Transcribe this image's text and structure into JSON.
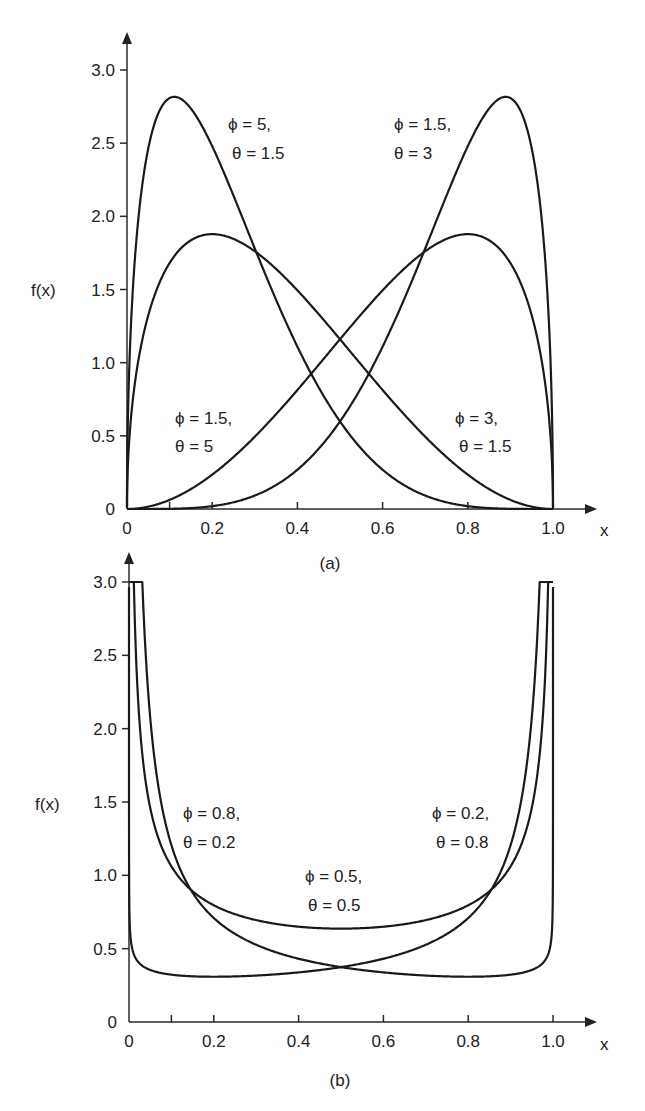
{
  "chart_data": [
    {
      "type": "line",
      "panel_label": "(a)",
      "title": "",
      "xlabel": "x",
      "ylabel": "f(x)",
      "xlim": [
        0,
        1.0
      ],
      "ylim": [
        0,
        3.0
      ],
      "x_ticks": [
        "0",
        "0.2",
        "0.4",
        "0.6",
        "0.8",
        "1.0"
      ],
      "x_minor_ticks": [
        0.1
      ],
      "y_ticks": [
        "0",
        "0.5",
        "1.0",
        "1.5",
        "2.0",
        "2.5",
        "3.0"
      ],
      "grid": false,
      "legend": "inline annotations",
      "series": [
        {
          "name": "φ = 5, θ = 1.5",
          "phi": 5,
          "theta": 1.5,
          "peak_x": 0.11,
          "peak_y": 2.82
        },
        {
          "name": "φ = 1.5, θ = 5",
          "phi": 1.5,
          "theta": 5,
          "peak_x": 0.2,
          "peak_y": 1.88
        },
        {
          "name": "φ = 1.5, θ = 3",
          "phi": 1.5,
          "theta": 3,
          "peak_x": 0.89,
          "peak_y": 2.82
        },
        {
          "name": "φ = 3, θ = 1.5",
          "phi": 3,
          "theta": 1.5,
          "peak_x": 0.8,
          "peak_y": 1.88
        }
      ],
      "annotations": [
        {
          "phi_label": "ϕ = 5,",
          "theta_label": "θ = 1.5"
        },
        {
          "phi_label": "ϕ = 1.5,",
          "theta_label": "θ = 3"
        },
        {
          "phi_label": "ϕ = 1.5,",
          "theta_label": "θ = 5"
        },
        {
          "phi_label": "ϕ = 3,",
          "theta_label": "θ = 1.5"
        }
      ]
    },
    {
      "type": "line",
      "panel_label": "(b)",
      "title": "",
      "xlabel": "x",
      "ylabel": "f(x)",
      "xlim": [
        0,
        1.0
      ],
      "ylim": [
        0,
        3.0
      ],
      "x_ticks": [
        "0",
        "0.2",
        "0.4",
        "0.6",
        "0.8",
        "1.0"
      ],
      "x_minor_ticks": [
        0.1
      ],
      "y_ticks": [
        "0",
        "0.5",
        "1.0",
        "1.5",
        "2.0",
        "2.5",
        "3.0"
      ],
      "grid": false,
      "legend": "inline annotations",
      "clip_note": "curves truncated flat at f(x)=3.0",
      "series": [
        {
          "name": "φ = 0.8, θ = 0.2",
          "phi": 0.8,
          "theta": 0.2,
          "min_x": 0.25,
          "min_y": 0.3
        },
        {
          "name": "φ = 0.2, θ = 0.8",
          "phi": 0.2,
          "theta": 0.8,
          "min_x": 0.77,
          "min_y": 0.3
        },
        {
          "name": "φ = 0.5, θ = 0.5",
          "phi": 0.5,
          "theta": 0.5,
          "min_x": 0.5,
          "min_y": 0.64
        }
      ],
      "annotations": [
        {
          "phi_label": "ϕ = 0.8,",
          "theta_label": "θ = 0.2"
        },
        {
          "phi_label": "ϕ = 0.2,",
          "theta_label": "θ = 0.8"
        },
        {
          "phi_label": "ϕ = 0.5,",
          "theta_label": "θ = 0.5"
        }
      ]
    }
  ]
}
